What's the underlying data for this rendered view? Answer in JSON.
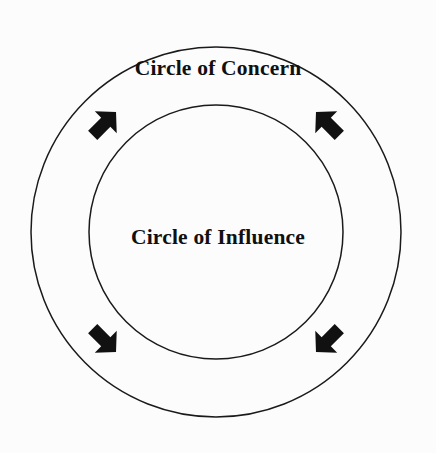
{
  "diagram": {
    "type": "concentric-circles",
    "background_color": "#fcfcfc",
    "stroke_color": "#1a1a1a",
    "arrow_color": "#111111",
    "outer_circle": {
      "label": "Circle of Concern",
      "center_x": 216,
      "center_y": 232,
      "radius": 185
    },
    "inner_circle": {
      "label": "Circle of Influence",
      "center_x": 216,
      "center_y": 232,
      "radius": 127
    },
    "arrows": [
      {
        "name": "arrow-top-left",
        "direction": "down-right",
        "points_inward": true,
        "x": 104,
        "y": 124,
        "rotation": -45
      },
      {
        "name": "arrow-top-right",
        "direction": "down-left",
        "points_inward": true,
        "x": 328,
        "y": 124,
        "rotation": -135
      },
      {
        "name": "arrow-bottom-left",
        "direction": "up-right",
        "points_inward": true,
        "x": 104,
        "y": 340,
        "rotation": 45
      },
      {
        "name": "arrow-bottom-right",
        "direction": "up-left",
        "points_inward": true,
        "x": 328,
        "y": 340,
        "rotation": 135
      }
    ]
  }
}
